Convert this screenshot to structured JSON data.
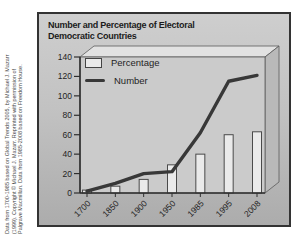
{
  "credit": {
    "line1": "Data from 1700-1985 based on Global Trends 2005, by Michael J. Mazarr",
    "line2": "(1999). Copyright © Michael J. Mazarr. Reprinted with permission of",
    "line3": "Palgrave Macmillan. Data from 1985-2008 based on Freedom House."
  },
  "figure": {
    "title_line1": "Number and Percentage of Electoral",
    "title_line2": "Democratic Countries"
  },
  "legend": {
    "items": [
      {
        "label": "Percentage"
      },
      {
        "label": "Number"
      }
    ]
  },
  "chart_data": {
    "type": "bar+line",
    "title": "Number and Percentage of Electoral Democratic Countries",
    "categories": [
      "1700",
      "1850",
      "1900",
      "1950",
      "1985",
      "1995",
      "2008"
    ],
    "series": [
      {
        "name": "Percentage",
        "type": "bar",
        "values": [
          3,
          7,
          14,
          29,
          40,
          60,
          63
        ]
      },
      {
        "name": "Number",
        "type": "line",
        "values": [
          2,
          10,
          20,
          22,
          62,
          115,
          121
        ]
      }
    ],
    "ylim": [
      0,
      140
    ],
    "yticks": [
      0,
      20,
      40,
      60,
      80,
      100,
      120,
      140
    ],
    "grid": false,
    "legend_position": "upper-left",
    "x_label_rotation": -45,
    "colors": {
      "bar_fill": "#eaeaea",
      "bar_stroke": "#4a4a4a",
      "line": "#383838",
      "axis": "#2f2f2f",
      "wall_fill": "#cbcbcb",
      "box_top_face": "#e2e2e2",
      "box_side_face": "#b9b9b9",
      "edge_stroke": "#5a5a5a",
      "tick_label": "#1f1f1f"
    }
  }
}
